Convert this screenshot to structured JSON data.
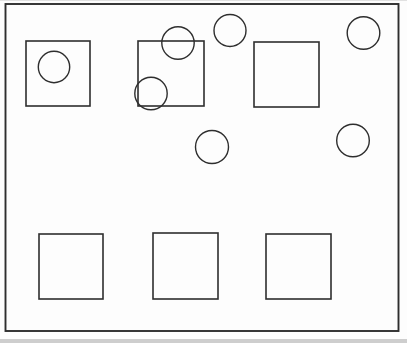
{
  "figure": {
    "background_color": "#fdfdfd",
    "stroke_color": "#2e2e2e",
    "canvas": {
      "width": 407,
      "height": 343
    },
    "frame": {
      "x": 5.5,
      "y": 4,
      "width": 393,
      "height": 327,
      "stroke_width": 1.9
    },
    "square_stroke_width": 1.6,
    "squares": [
      {
        "name": "square-top-left",
        "x": 26,
        "y": 41,
        "width": 64,
        "height": 65
      },
      {
        "name": "square-top-middle",
        "x": 138,
        "y": 41,
        "width": 66,
        "height": 65
      },
      {
        "name": "square-top-right",
        "x": 254,
        "y": 42,
        "width": 65,
        "height": 65
      },
      {
        "name": "square-bottom-left",
        "x": 39,
        "y": 234,
        "width": 64,
        "height": 65
      },
      {
        "name": "square-bottom-middle",
        "x": 153,
        "y": 233,
        "width": 65,
        "height": 66
      },
      {
        "name": "square-bottom-right",
        "x": 266,
        "y": 234,
        "width": 65,
        "height": 65
      }
    ],
    "circle_stroke_width": 1.4,
    "circles": [
      {
        "name": "circle-inside-top-left-square",
        "cx": 54,
        "cy": 67,
        "r": 15.7
      },
      {
        "name": "circle-on-top-edge-of-middle-square",
        "cx": 178,
        "cy": 43,
        "r": 16.2
      },
      {
        "name": "circle-on-bottom-left-corner-of-middle-square",
        "cx": 151,
        "cy": 93.5,
        "r": 16.2
      },
      {
        "name": "circle-top-center",
        "cx": 230,
        "cy": 30.5,
        "r": 16.0
      },
      {
        "name": "circle-top-right",
        "cx": 363.5,
        "cy": 33,
        "r": 16.3
      },
      {
        "name": "circle-mid-center",
        "cx": 212,
        "cy": 147,
        "r": 16.5
      },
      {
        "name": "circle-mid-right",
        "cx": 353,
        "cy": 140.5,
        "r": 16.3
      }
    ],
    "scan_edges": {
      "top_line_color": "#d9d9d9",
      "bottom_strip_color": "#c9c9c9"
    }
  }
}
